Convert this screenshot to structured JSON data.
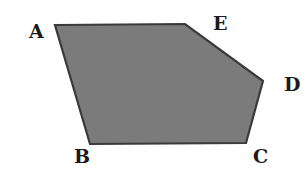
{
  "diagram": {
    "type": "pentagon",
    "fill_color": "#7b7b7b",
    "stroke_color": "#3a3a3a",
    "vertices": [
      {
        "name": "A",
        "x": 55,
        "y": 25,
        "label_x": 29,
        "label_y": 38
      },
      {
        "name": "E",
        "x": 185,
        "y": 24,
        "label_x": 213,
        "label_y": 30
      },
      {
        "name": "D",
        "x": 263,
        "y": 81,
        "label_x": 284,
        "label_y": 91
      },
      {
        "name": "C",
        "x": 246,
        "y": 143,
        "label_x": 253,
        "label_y": 163
      },
      {
        "name": "B",
        "x": 90,
        "y": 144,
        "label_x": 74,
        "label_y": 163
      }
    ],
    "labels": {
      "A": "A",
      "B": "B",
      "C": "C",
      "D": "D",
      "E": "E"
    }
  }
}
